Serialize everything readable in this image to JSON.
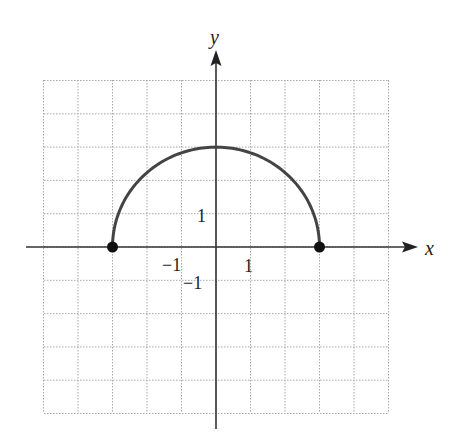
{
  "chart_data": {
    "type": "line",
    "title": "",
    "xlabel": "x",
    "ylabel": "y",
    "xlim": [
      -5,
      5
    ],
    "ylim": [
      -5,
      5
    ],
    "grid": true,
    "x_tick_labels": [
      {
        "value": -1,
        "label": "−1"
      },
      {
        "value": 1,
        "label": "1"
      }
    ],
    "y_tick_labels": [
      {
        "value": 1,
        "label": "1"
      },
      {
        "value": -1,
        "label": "−1"
      }
    ],
    "series": [
      {
        "name": "semicircle",
        "x": [
          -3,
          -2.5,
          -2,
          -1.5,
          -1,
          -0.5,
          0,
          0.5,
          1,
          1.5,
          2,
          2.5,
          3
        ],
        "y": [
          0,
          1.66,
          2.24,
          2.6,
          2.83,
          2.96,
          3,
          2.96,
          2.83,
          2.6,
          2.24,
          1.66,
          0
        ],
        "color": "#444444"
      }
    ],
    "points": [
      {
        "x": -3,
        "y": 0,
        "style": "closed-dot"
      },
      {
        "x": 3,
        "y": 0,
        "style": "closed-dot"
      }
    ]
  },
  "labels": {
    "x_axis": "x",
    "y_axis": "y",
    "x_tick_neg1": "−1",
    "x_tick_pos1": "1",
    "y_tick_pos1": "1",
    "y_tick_neg1": "−1"
  },
  "colors": {
    "curve": "#444444",
    "axis": "#333333",
    "grid": "#a8a8a8",
    "dot": "#111111"
  }
}
